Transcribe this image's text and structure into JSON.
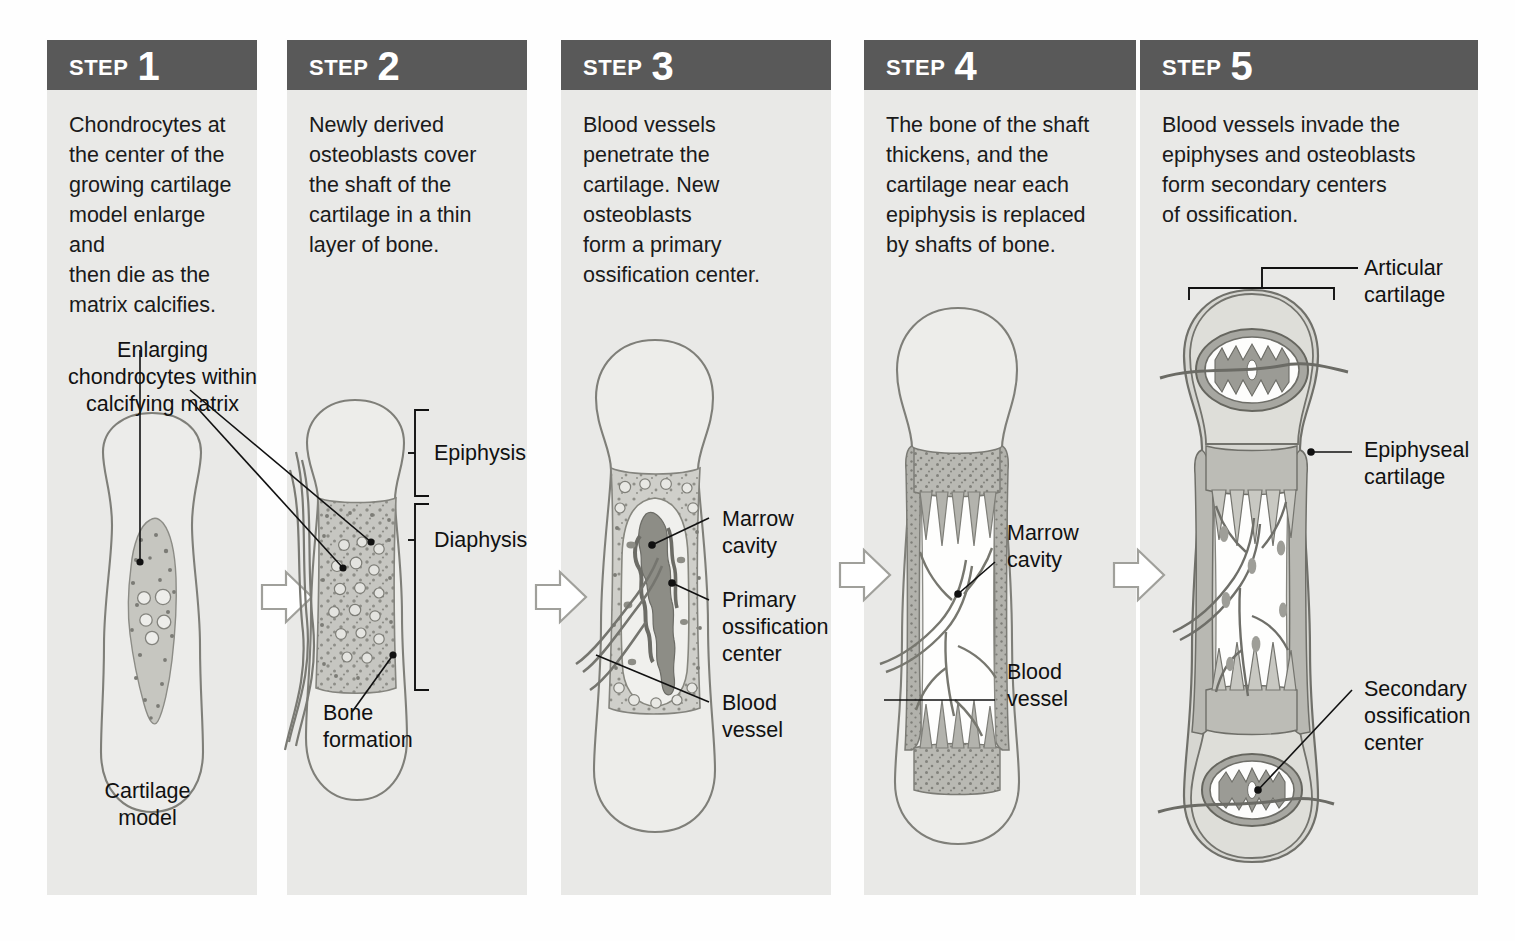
{
  "figure": {
    "panel_bg": "#e9e9e7",
    "header_bg": "#595959",
    "header_text_color": "#ffffff",
    "body_text_color": "#1a1a1a"
  },
  "steps": [
    {
      "step_word": "STEP",
      "number": "1",
      "text": "Chondrocytes at\nthe center of the\ngrowing cartilage\nmodel enlarge and\nthen die as the\nmatrix calcifies.",
      "labels": [
        {
          "id": "enlarging-chondrocytes",
          "text": "Enlarging\nchondrocytes within\ncalcifying matrix"
        },
        {
          "id": "cartilage-model",
          "text": "Cartilage\nmodel"
        }
      ]
    },
    {
      "step_word": "STEP",
      "number": "2",
      "text": "Newly derived\nosteoblasts cover\nthe shaft of the\ncartilage in a thin\nlayer of bone.",
      "labels": [
        {
          "id": "epiphysis",
          "text": "Epiphysis"
        },
        {
          "id": "diaphysis",
          "text": "Diaphysis"
        },
        {
          "id": "bone-formation",
          "text": "Bone\nformation"
        }
      ]
    },
    {
      "step_word": "STEP",
      "number": "3",
      "text": "Blood vessels\npenetrate the\ncartilage. New\nosteoblasts\nform a primary\nossification center.",
      "labels": [
        {
          "id": "marrow-cavity",
          "text": "Marrow\ncavity"
        },
        {
          "id": "primary-ossification-center",
          "text": "Primary\nossification\ncenter"
        },
        {
          "id": "blood-vessel",
          "text": "Blood\nvessel"
        }
      ]
    },
    {
      "step_word": "STEP",
      "number": "4",
      "text": "The bone of the shaft\nthickens, and the\ncartilage near each\nepiphysis is replaced\nby shafts of bone.",
      "labels": [
        {
          "id": "marrow-cavity",
          "text": "Marrow\ncavity"
        },
        {
          "id": "blood-vessel",
          "text": "Blood\nvessel"
        }
      ]
    },
    {
      "step_word": "STEP",
      "number": "5",
      "text": "Blood vessels invade the\nepiphyses and osteoblasts\nform secondary centers\nof ossification.",
      "labels": [
        {
          "id": "articular-cartilage",
          "text": "Articular\ncartilage"
        },
        {
          "id": "epiphyseal-cartilage",
          "text": "Epiphyseal\ncartilage"
        },
        {
          "id": "secondary-ossification-center",
          "text": "Secondary\nossification\ncenter"
        }
      ]
    }
  ],
  "colors": {
    "cartilage_fill": "#ededea",
    "cartilage_stroke": "#8a8a85",
    "calcified_matrix": "#c2c2bd",
    "bone_gray": "#a9a9a3",
    "dark_trabecula": "#8e8e88",
    "marrow_white": "#fdfdfc",
    "vessel": "#6f6f69",
    "arrow_stroke": "#9a9a95"
  }
}
